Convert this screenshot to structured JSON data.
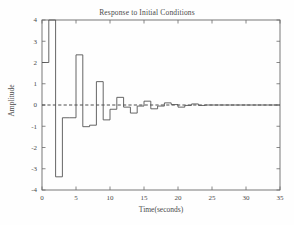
{
  "chart_data": {
    "type": "line",
    "title": "Response to Initial Conditions",
    "xlabel": "Time(seconds)",
    "ylabel": "Amplitude",
    "xlim": [
      0,
      35
    ],
    "ylim": [
      -4,
      4
    ],
    "xticks": [
      0,
      5,
      10,
      15,
      20,
      25,
      30,
      35
    ],
    "xticklabels": [
      "0",
      "5",
      "10",
      "15",
      "20",
      "25",
      "30",
      "35"
    ],
    "yticks": [
      -4,
      -3,
      -2,
      -1,
      0,
      1,
      2,
      3,
      4
    ],
    "yticklabels": [
      "-4",
      "-3",
      "-2",
      "-1",
      "0",
      "1",
      "2",
      "3",
      "4"
    ],
    "grid": false,
    "legend": false,
    "drawstyle": "steps-post",
    "line_color": "#555555",
    "zero_line": {
      "value": 0,
      "style": "dashed",
      "color": "#3a3a3a"
    },
    "series": [
      {
        "name": "response",
        "x": [
          0,
          1,
          2,
          3,
          4,
          5,
          6,
          7,
          8,
          9,
          10,
          11,
          12,
          13,
          14,
          15,
          16,
          17,
          18,
          19,
          20,
          21,
          22,
          23,
          24,
          25,
          26,
          27,
          28,
          29,
          30,
          31,
          32,
          33,
          34,
          35
        ],
        "values": [
          2.0,
          4.0,
          -3.38,
          -0.6,
          -0.6,
          2.36,
          -1.02,
          -0.95,
          1.1,
          -0.7,
          -0.2,
          0.36,
          -0.1,
          -0.38,
          -0.05,
          0.18,
          -0.18,
          -0.05,
          0.1,
          0.02,
          -0.1,
          -0.02,
          0.05,
          -0.02,
          0.0,
          0.0,
          0.0,
          0.0,
          0.0,
          0.0,
          0.0,
          0.0,
          0.0,
          0.0,
          0.0,
          0.0
        ]
      }
    ]
  },
  "figure": {
    "background_color": "#fefefe",
    "axis_color": "#6a6a6a"
  }
}
